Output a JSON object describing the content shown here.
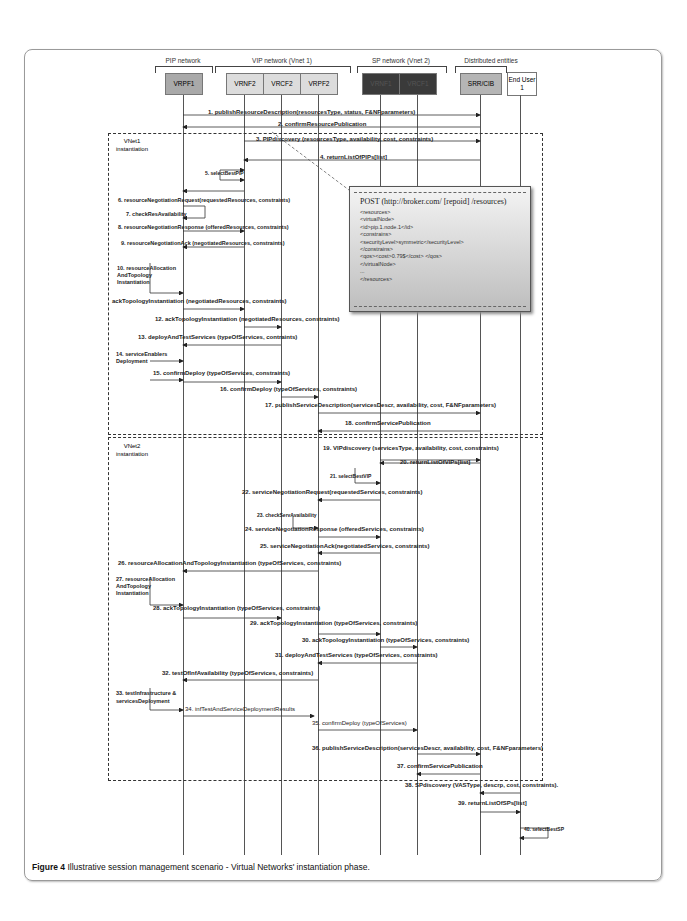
{
  "groups": [
    {
      "label": "PIP network"
    },
    {
      "label": "VIP network (Vnet 1)"
    },
    {
      "label": "SP network (Vnet 2)"
    },
    {
      "label": "Distributed entities"
    }
  ],
  "entities": [
    {
      "label": "VRPF1",
      "color": "#a9a9a9"
    },
    {
      "label": "VRNF2",
      "color": "#dcdcdc"
    },
    {
      "label": "VRCF2",
      "color": "#dcdcdc"
    },
    {
      "label": "VRPF2",
      "color": "#dcdcdc"
    },
    {
      "label": "VRNF1",
      "color": "#3a3a3a"
    },
    {
      "label": "VRCF1",
      "color": "#3a3a3a"
    },
    {
      "label": "SRR/CIB",
      "color": "#b5b5b5"
    },
    {
      "label": "End User 1",
      "color": "#ffffff"
    }
  ],
  "phases": [
    {
      "label": "VNet1 instantiation"
    },
    {
      "label": "VNet2 instantiation"
    }
  ],
  "messages": [
    "1. publishResourceDescription(resourcesType, status, F&NFparameters)",
    "2. confirmResourcePublication",
    "3. PIPdiscovery (resourcesType, availability, cost, constraints)",
    "4. returnListOfPIPs[list]",
    "5. selectBestPIP",
    "6. resourceNegotiationRequest(requestedResources, constraints)",
    "7. checkResAvailability",
    "8. resourceNegotiationResponse (offeredResources, constraints)",
    "9. resourceNegotiationAck (negotiatedResources, constraints)",
    "10. resourceAllocation",
    "AndTopology",
    "Instantiation",
    "ackTopologyInstantiation (negotiatedResources, constraints)",
    "12. ackTopologyInstantiation (negotiatedResources, constraints)",
    "13. deployAndTestServices (typeOfServices, contraints)",
    "14. serviceEnablers",
    "Deployment",
    "15. confirmDeploy (typeOfServices, constraints)",
    "16. confirmDeploy (typeOfServices, constraints)",
    "17. publishServiceDescription(servicesDescr, availability, cost, F&NFparameters)",
    "18. confirmServicePublication",
    "19. VIPdiscovery (servicesType, availability, cost, constraints)",
    "20. returnListOfVIPs[list]",
    "21. selectBestVIP",
    "22. serviceNegotiationRequest(requestedServices, constraints)",
    "23. checkServAvailability",
    "24. serviceNegotiationResponse (offeredServices, constraints)",
    "25. serviceNegotiationAck(negotiatedServices, constraints)",
    "26. resourceAllocationAndTopologyInstantiation (typeOfServices, constraints)",
    "27. resourceAllocation",
    "AndTopology",
    "Instantiation",
    "28. ackTopologyInstantiation (typeOfServices, constraints)",
    "29. ackTopologyInstantiation (typeOfServices, constraints)",
    "30. ackTopologyInstantiation (typeOfServices, constraints)",
    "31. deployAndTestServices (typeOfServices, constraints)",
    "32. testOfInfAvailability (typeOfServices, constraints)",
    "33. testInfrastructure &",
    "servicesDeployment",
    "34. infTestAndServiceDeploymentResults",
    "35. confirmDeploy (typeOfServices)",
    "36. publishServiceDescription(servicesDescr, availability, cost, F&NFparameters)",
    "37. confirmServicePublication",
    "38. SPdiscovery (VASType, descrp, cost, constraints).",
    "39. returnListOfSPs[list]",
    "40. selectBestSP"
  ],
  "post_box": {
    "header": "POST (http://broker.com/ [repoid] /resources)",
    "lines": [
      "<resources>",
      "<virtualNode>",
      "<id>pip.1.node.1</id>",
      "<constrains>",
      "<securityLevel>symmetric</securityLevel>",
      "</constrains>",
      "<qos><cost>0.79$</cost> </qos>",
      "</virtualNode>",
      "...",
      "</resources>"
    ]
  },
  "caption": {
    "label": "Figure 4",
    "text": "Illustrative session management scenario - Virtual Networks' instantiation phase."
  }
}
